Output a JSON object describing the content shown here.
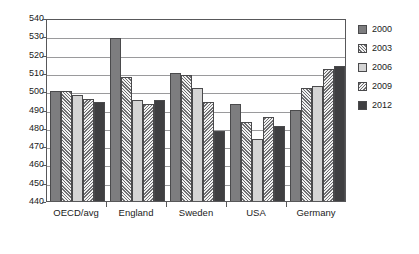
{
  "chart_data": {
    "type": "bar",
    "title": "",
    "xlabel": "",
    "ylabel": "",
    "ylim": [
      440,
      540
    ],
    "ytick_step": 10,
    "yticks": [
      540,
      530,
      520,
      510,
      500,
      490,
      480,
      470,
      460,
      450,
      440
    ],
    "grid": true,
    "legend_position": "right",
    "categories": [
      "OECD/avg",
      "England",
      "Sweden",
      "USA",
      "Germany"
    ],
    "series": [
      {
        "name": "2000",
        "color": "#7d7d7f",
        "pattern": "solid-gray",
        "values": [
          500,
          529,
          510,
          493,
          490
        ]
      },
      {
        "name": "2003",
        "color": "#f2f2f2",
        "pattern": "hatch-forward",
        "values": [
          500,
          508,
          509,
          483,
          502
        ]
      },
      {
        "name": "2006",
        "color": "#d4d4d4",
        "pattern": "solid-light",
        "values": [
          498,
          495,
          502,
          474,
          503
        ]
      },
      {
        "name": "2009",
        "color": "#f2f2f2",
        "pattern": "hatch-back",
        "values": [
          496,
          493,
          494,
          486,
          512
        ]
      },
      {
        "name": "2012",
        "color": "#3f3f41",
        "pattern": "solid-dark",
        "values": [
          494,
          495,
          478,
          481,
          514
        ]
      }
    ]
  },
  "legend": {
    "items": [
      {
        "label": "2000"
      },
      {
        "label": "2003"
      },
      {
        "label": "2006"
      },
      {
        "label": "2009"
      },
      {
        "label": "2012"
      }
    ]
  }
}
